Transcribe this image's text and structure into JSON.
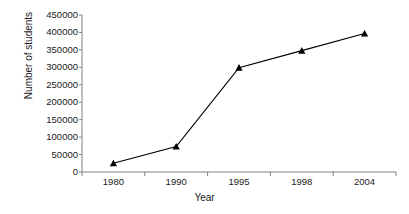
{
  "chart_data": {
    "type": "line",
    "title": "",
    "xlabel": "Year",
    "ylabel": "Number of students",
    "categories": [
      "1980",
      "1990",
      "1995",
      "1998",
      "2004"
    ],
    "values": [
      25000,
      73000,
      299000,
      348000,
      397000
    ],
    "series": [
      {
        "name": "Number of students",
        "values": [
          25000,
          73000,
          299000,
          348000,
          397000
        ]
      }
    ],
    "ylim": [
      0,
      450000
    ],
    "ytick_labels": [
      "0",
      "50000",
      "100000",
      "150000",
      "200000",
      "250000",
      "300000",
      "350000",
      "400000",
      "450000"
    ],
    "ytick_values": [
      0,
      50000,
      100000,
      150000,
      200000,
      250000,
      300000,
      350000,
      400000,
      450000
    ],
    "ytick_step": 50000,
    "grid": false,
    "legend": false,
    "legend_position": "none",
    "marker": "triangle",
    "line_color": "#000000",
    "marker_color": "#000000",
    "background_color": "#ffffff",
    "axis_color": "#808080"
  }
}
